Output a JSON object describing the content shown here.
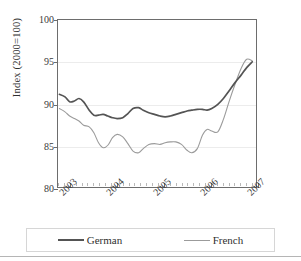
{
  "chart_data": {
    "type": "line",
    "title": "",
    "xlabel": "",
    "ylabel": "Index (2000=100)",
    "ylim": [
      80,
      100
    ],
    "yticks": [
      80,
      85,
      90,
      95,
      100
    ],
    "xlim": [
      2002.75,
      2007.0
    ],
    "xticks": [
      2003,
      2004,
      2005,
      2006,
      2007
    ],
    "xtick_labels": [
      "2003",
      "2004",
      "2005",
      "2006",
      "2007"
    ],
    "grid": "horizontal",
    "legend_position": "bottom",
    "legend": [
      "German",
      "French"
    ],
    "colors": {
      "german": "#545454",
      "french": "#9b9b9b"
    },
    "x": [
      2002.78,
      2002.9,
      2003.0,
      2003.1,
      2003.2,
      2003.3,
      2003.42,
      2003.52,
      2003.62,
      2003.72,
      2003.82,
      2003.92,
      2004.02,
      2004.14,
      2004.25,
      2004.36,
      2004.48,
      2004.58,
      2004.7,
      2004.82,
      2004.94,
      2005.05,
      2005.16,
      2005.28,
      2005.4,
      2005.52,
      2005.62,
      2005.74,
      2005.85,
      2005.95,
      2006.05,
      2006.18,
      2006.3,
      2006.42,
      2006.55,
      2006.68,
      2006.8,
      2006.92
    ],
    "series": [
      {
        "name": "German",
        "values": [
          91.1,
          90.8,
          90.2,
          90.3,
          90.6,
          90.2,
          89.2,
          88.6,
          88.6,
          88.7,
          88.5,
          88.3,
          88.2,
          88.3,
          88.8,
          89.4,
          89.5,
          89.2,
          88.9,
          88.7,
          88.5,
          88.4,
          88.5,
          88.7,
          88.9,
          89.1,
          89.2,
          89.3,
          89.3,
          89.2,
          89.4,
          89.9,
          90.6,
          91.5,
          92.5,
          93.4,
          94.3,
          95.0
        ]
      },
      {
        "name": "French",
        "values": [
          89.4,
          89.0,
          88.5,
          88.2,
          87.9,
          87.4,
          87.2,
          86.5,
          85.3,
          84.7,
          85.0,
          85.9,
          86.3,
          86.0,
          85.2,
          84.3,
          84.1,
          84.6,
          85.1,
          85.2,
          85.1,
          85.3,
          85.4,
          85.4,
          85.1,
          84.4,
          84.1,
          84.6,
          86.2,
          86.9,
          86.7,
          86.6,
          88.1,
          90.2,
          92.3,
          94.2,
          95.3,
          95.1
        ]
      }
    ]
  }
}
